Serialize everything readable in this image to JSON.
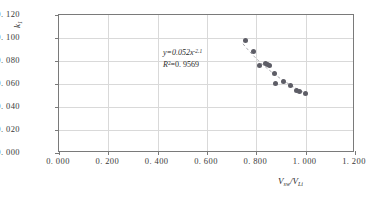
{
  "chart_data": {
    "type": "scatter",
    "title": "",
    "xlabel": "Vsw/VLi",
    "ylabel": "k1",
    "xlim": [
      0.0,
      1.2
    ],
    "ylim": [
      0.0,
      0.12
    ],
    "xticks": [
      "0. 000",
      "0. 200",
      "0. 400",
      "0. 600",
      "0. 800",
      "1. 000",
      "1. 200"
    ],
    "xtick_values": [
      0.0,
      0.2,
      0.4,
      0.6,
      0.8,
      1.0,
      1.2
    ],
    "yticks": [
      "0. 000",
      "0. 020",
      "0. 040",
      "0. 060",
      "0. 080",
      "0. 100",
      "0. 120"
    ],
    "ytick_values": [
      0.0,
      0.02,
      0.04,
      0.06,
      0.08,
      0.1,
      0.12
    ],
    "grid": true,
    "legend": "none",
    "marker_color": "#5d5d66",
    "trendline_color": "#9a9aa0",
    "trendline": "dashed power law",
    "points": [
      {
        "x": 0.757,
        "y": 0.0975
      },
      {
        "x": 0.79,
        "y": 0.0885
      },
      {
        "x": 0.812,
        "y": 0.0758
      },
      {
        "x": 0.838,
        "y": 0.078
      },
      {
        "x": 0.845,
        "y": 0.0768
      },
      {
        "x": 0.853,
        "y": 0.076
      },
      {
        "x": 0.872,
        "y": 0.069
      },
      {
        "x": 0.878,
        "y": 0.0605
      },
      {
        "x": 0.91,
        "y": 0.0625
      },
      {
        "x": 0.938,
        "y": 0.0583
      },
      {
        "x": 0.963,
        "y": 0.0543
      },
      {
        "x": 0.975,
        "y": 0.0535
      },
      {
        "x": 1.0,
        "y": 0.0518
      }
    ],
    "annotations": {
      "equation_prefix": "y=0.052x",
      "equation_exponent": "-2.1",
      "r2_symbol": "R",
      "r2_sup": "2",
      "r2_value": "=0. 9569"
    }
  }
}
